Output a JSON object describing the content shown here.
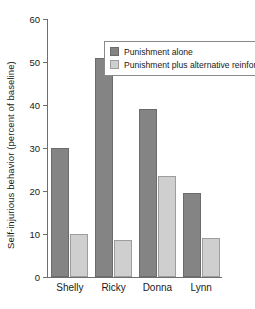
{
  "chart_data": {
    "type": "bar",
    "title": "",
    "xlabel": "",
    "ylabel": "Self-injurious behavior (percent of baseline)",
    "categories": [
      "Shelly",
      "Ricky",
      "Donna",
      "Lynn"
    ],
    "series": [
      {
        "name": "Punishment alone",
        "color": "#848484",
        "values": [
          30,
          51,
          39,
          19.5
        ]
      },
      {
        "name": "Punishment plus alternative reinforcer",
        "color": "#cfcfcf",
        "values": [
          10,
          8.6,
          23.5,
          9
        ]
      }
    ],
    "ylim": [
      0,
      60
    ],
    "yticks": [
      0,
      10,
      20,
      30,
      40,
      50,
      60
    ],
    "ytick_labels": [
      "0",
      "10",
      "20",
      "30",
      "40",
      "50",
      "60"
    ],
    "grid": false,
    "legend_position": "top-left-inside"
  },
  "legend": {
    "entries": [
      {
        "label": "Punishment alone",
        "swatch": "dark"
      },
      {
        "label": "Punishment plus alternative reinforcer",
        "swatch": "light"
      }
    ]
  }
}
